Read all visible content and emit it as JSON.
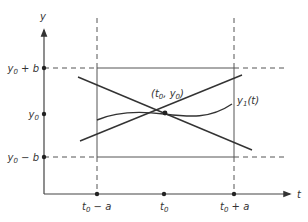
{
  "figure": {
    "axes": {
      "x_label": "t",
      "y_label": "y",
      "origin": [
        44,
        194
      ],
      "x_axis_end": 292,
      "y_axis_top": 26
    },
    "y_ticks": [
      {
        "label_main": "y",
        "label_sub": "0",
        "label_rest": " + b",
        "y": 68
      },
      {
        "label_main": "y",
        "label_sub": "0",
        "label_rest": "",
        "y": 114
      },
      {
        "label_main": "y",
        "label_sub": "0",
        "label_rest": " − b",
        "y": 157
      }
    ],
    "x_ticks": [
      {
        "label_main": "t",
        "label_sub": "0",
        "label_rest": " − a",
        "x": 97
      },
      {
        "label_main": "t",
        "label_sub": "0",
        "label_rest": "",
        "x": 164
      },
      {
        "label_main": "t",
        "label_sub": "0",
        "label_rest": " + a",
        "x": 234
      }
    ],
    "center_point": {
      "label": "(t0, y0)",
      "label_t": "(t",
      "label_t_sub": "0",
      "label_mid": ", y",
      "label_y_sub": "0",
      "label_end": ")"
    },
    "curve_label": {
      "main": "y",
      "sub": "1",
      "rest": "(t)"
    },
    "colors": {
      "line": "#333333",
      "dash": "#555555",
      "background": "#ffffff"
    }
  }
}
